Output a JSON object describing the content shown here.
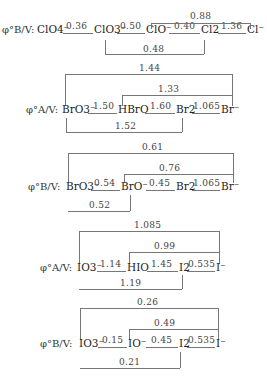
{
  "diagrams": [
    {
      "label": "φ°B/V:",
      "species": [
        "ClO4⁻",
        "ClO3⁻",
        "ClO⁻",
        "Cl2",
        "Cl⁻"
      ],
      "steps": [
        "0.36",
        "0.50",
        "0.40",
        "1.36"
      ],
      "brackets": [
        {
          "value": "0.88",
          "from": "ClO⁻",
          "to": "Cl⁻",
          "position": "top"
        },
        {
          "value": "0.48",
          "from": "ClO3⁻",
          "to": "Cl2",
          "position": "bottom"
        }
      ]
    },
    {
      "label": "φ°A/V:",
      "species": [
        "BrO3⁻",
        "HBrO",
        "Br2",
        "Br⁻"
      ],
      "steps": [
        "1.50",
        "1.60",
        "1.065"
      ],
      "brackets": [
        {
          "value": "1.44",
          "from": "BrO3⁻",
          "to": "Br⁻",
          "position": "top"
        },
        {
          "value": "1.33",
          "from": "HBrO",
          "to": "Br⁻",
          "position": "top"
        },
        {
          "value": "1.52",
          "from": "BrO3⁻",
          "to": "Br2",
          "position": "bottom"
        }
      ]
    },
    {
      "label": "φ°B/V:",
      "species": [
        "BrO3⁻",
        "BrO⁻",
        "Br2",
        "Br⁻"
      ],
      "steps": [
        "0.54",
        "0.45",
        "1.065"
      ],
      "brackets": [
        {
          "value": "0.61",
          "from": "BrO3⁻",
          "to": "Br⁻",
          "position": "top"
        },
        {
          "value": "0.76",
          "from": "BrO⁻",
          "to": "Br⁻",
          "position": "top"
        },
        {
          "value": "0.52",
          "from": "BrO3⁻",
          "to": "BrO⁻",
          "position": "bottom"
        }
      ]
    },
    {
      "label": "φ°A/V:",
      "species": [
        "IO3⁻",
        "HIO",
        "I2",
        "I⁻"
      ],
      "steps": [
        "1.14",
        "1.45",
        "0.535"
      ],
      "brackets": [
        {
          "value": "1.085",
          "from": "IO3⁻",
          "to": "I⁻",
          "position": "top"
        },
        {
          "value": "0.99",
          "from": "HIO",
          "to": "I⁻",
          "position": "top"
        },
        {
          "value": "1.19",
          "from": "IO3⁻",
          "to": "I2",
          "position": "bottom"
        }
      ]
    },
    {
      "label": "φ°B/V:",
      "species": [
        "IO3⁻",
        "IO⁻",
        "I2",
        "I⁻"
      ],
      "steps": [
        "0.15",
        "0.45",
        "0.535"
      ],
      "brackets": [
        {
          "value": "0.26",
          "from": "IO3⁻",
          "to": "I⁻",
          "position": "top"
        },
        {
          "value": "0.49",
          "from": "IO⁻",
          "to": "I⁻",
          "position": "top"
        },
        {
          "value": "0.21",
          "from": "IO3⁻",
          "to": "I2",
          "position": "bottom"
        }
      ]
    }
  ]
}
